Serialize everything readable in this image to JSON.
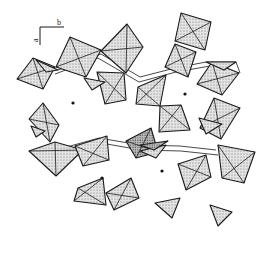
{
  "figure": {
    "type": "crystal-structure-polyhedral-projection",
    "background": "#ffffff",
    "stroke_color": "#1a1a1a",
    "shade_color": "#cfcfcf",
    "dark_shade_color": "#a8a8a8"
  },
  "axes": {
    "horizontal_label": "b",
    "vertical_label": "a",
    "origin": [
      40,
      27
    ],
    "h_end": [
      64,
      27
    ],
    "v_end": [
      40,
      45
    ]
  },
  "channel_centers": [
    {
      "x": 73,
      "y": 103
    },
    {
      "x": 185,
      "y": 94
    },
    {
      "x": 102,
      "y": 178
    },
    {
      "x": 162,
      "y": 171
    }
  ],
  "octahedra": [
    {
      "pts": [
        [
          17,
          79
        ],
        [
          33,
          58
        ],
        [
          55,
          67
        ],
        [
          43,
          89
        ]
      ],
      "shade": "light"
    },
    {
      "pts": [
        [
          70,
          37
        ],
        [
          101,
          50
        ],
        [
          86,
          77
        ],
        [
          56,
          67
        ]
      ],
      "shade": "light"
    },
    {
      "pts": [
        [
          127,
          24
        ],
        [
          143,
          47
        ],
        [
          126,
          73
        ],
        [
          101,
          51
        ]
      ],
      "shade": "light"
    },
    {
      "pts": [
        [
          181,
          13
        ],
        [
          211,
          22
        ],
        [
          205,
          50
        ],
        [
          175,
          41
        ]
      ],
      "shade": "light"
    },
    {
      "pts": [
        [
          175,
          44
        ],
        [
          196,
          52
        ],
        [
          188,
          77
        ],
        [
          165,
          67
        ]
      ],
      "shade": "light"
    },
    {
      "pts": [
        [
          212,
          62
        ],
        [
          239,
          73
        ],
        [
          222,
          95
        ],
        [
          197,
          84
        ]
      ],
      "shade": "light"
    },
    {
      "pts": [
        [
          214,
          98
        ],
        [
          240,
          108
        ],
        [
          221,
          139
        ],
        [
          200,
          128
        ]
      ],
      "shade": "light"
    },
    {
      "pts": [
        [
          160,
          106
        ],
        [
          181,
          105
        ],
        [
          190,
          130
        ],
        [
          159,
          132
        ]
      ],
      "shade": "light"
    },
    {
      "pts": [
        [
          43,
          103
        ],
        [
          59,
          125
        ],
        [
          50,
          142
        ],
        [
          29,
          119
        ]
      ],
      "shade": "light"
    },
    {
      "pts": [
        [
          29,
          151
        ],
        [
          55,
          142
        ],
        [
          83,
          150
        ],
        [
          56,
          176
        ]
      ],
      "shade": "light"
    },
    {
      "pts": [
        [
          75,
          146
        ],
        [
          107,
          136
        ],
        [
          109,
          160
        ],
        [
          83,
          166
        ]
      ],
      "shade": "light"
    },
    {
      "pts": [
        [
          126,
          141
        ],
        [
          151,
          128
        ],
        [
          158,
          152
        ],
        [
          136,
          158
        ]
      ],
      "shade": "dark"
    },
    {
      "pts": [
        [
          78,
          188
        ],
        [
          103,
          178
        ],
        [
          106,
          205
        ],
        [
          74,
          201
        ]
      ],
      "shade": "light"
    },
    {
      "pts": [
        [
          106,
          193
        ],
        [
          131,
          178
        ],
        [
          139,
          198
        ],
        [
          114,
          210
        ]
      ],
      "shade": "light"
    },
    {
      "pts": [
        [
          178,
          164
        ],
        [
          206,
          155
        ],
        [
          211,
          177
        ],
        [
          186,
          190
        ]
      ],
      "shade": "light"
    },
    {
      "pts": [
        [
          218,
          145
        ],
        [
          255,
          152
        ],
        [
          244,
          183
        ],
        [
          222,
          178
        ]
      ],
      "shade": "light"
    },
    {
      "pts": [
        [
          97,
          72
        ],
        [
          124,
          73
        ],
        [
          126,
          100
        ],
        [
          105,
          104
        ]
      ],
      "shade": "light"
    },
    {
      "pts": [
        [
          138,
          87
        ],
        [
          166,
          75
        ],
        [
          160,
          106
        ],
        [
          136,
          104
        ]
      ],
      "shade": "light"
    }
  ],
  "tetrahedra": [
    {
      "pts": [
        [
          36,
          60
        ],
        [
          58,
          70
        ],
        [
          46,
          72
        ]
      ],
      "shade": "light"
    },
    {
      "pts": [
        [
          84,
          78
        ],
        [
          105,
          82
        ],
        [
          92,
          90
        ]
      ],
      "shade": "light"
    },
    {
      "pts": [
        [
          206,
          62
        ],
        [
          236,
          62
        ],
        [
          224,
          70
        ]
      ],
      "shade": "light"
    },
    {
      "pts": [
        [
          140,
          151
        ],
        [
          166,
          145
        ],
        [
          156,
          158
        ]
      ],
      "shade": "light"
    },
    {
      "pts": [
        [
          140,
          145
        ],
        [
          168,
          141
        ],
        [
          154,
          150
        ]
      ],
      "shade": "dark"
    },
    {
      "pts": [
        [
          155,
          203
        ],
        [
          180,
          198
        ],
        [
          172,
          218
        ]
      ],
      "shade": "light"
    },
    {
      "pts": [
        [
          210,
          205
        ],
        [
          232,
          212
        ],
        [
          218,
          226
        ]
      ],
      "shade": "light"
    },
    {
      "pts": [
        [
          31,
          126
        ],
        [
          45,
          131
        ],
        [
          36,
          137
        ]
      ],
      "shade": "light"
    },
    {
      "pts": [
        [
          199,
          118
        ],
        [
          222,
          124
        ],
        [
          206,
          134
        ]
      ],
      "shade": "light"
    }
  ],
  "chains": [
    {
      "pts": [
        [
          58,
          70
        ],
        [
          101,
          54
        ],
        [
          140,
          77
        ],
        [
          175,
          68
        ],
        [
          206,
          62
        ],
        [
          236,
          62
        ],
        [
          240,
          73
        ]
      ]
    },
    {
      "pts": [
        [
          55,
          74
        ],
        [
          98,
          58
        ],
        [
          139,
          82
        ],
        [
          176,
          72
        ],
        [
          210,
          66
        ]
      ]
    },
    {
      "pts": [
        [
          56,
          150
        ],
        [
          99,
          138
        ],
        [
          140,
          145
        ],
        [
          180,
          146
        ],
        [
          216,
          150
        ]
      ]
    },
    {
      "pts": [
        [
          58,
          155
        ],
        [
          101,
          143
        ],
        [
          141,
          150
        ],
        [
          181,
          151
        ],
        [
          218,
          155
        ]
      ]
    }
  ]
}
